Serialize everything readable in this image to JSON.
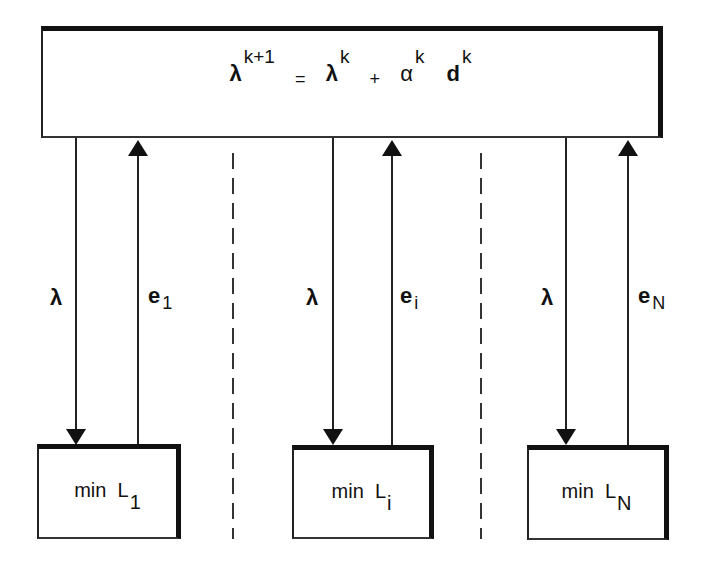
{
  "coordinator": {
    "lhs_symbol": "λ",
    "lhs_superscript": "k+1",
    "equals": "=",
    "term1_symbol": "λ",
    "term1_superscript": "k",
    "plus": "+",
    "term2_symbol": "α",
    "term2_superscript": "k",
    "term3_symbol": "d",
    "term3_superscript": "k"
  },
  "subproblems": [
    {
      "label": "min",
      "symbol": "L",
      "subscript": "1",
      "down_label": "λ",
      "up_label": "e",
      "up_subscript": "1"
    },
    {
      "label": "min",
      "symbol": "L",
      "subscript": "i",
      "down_label": "λ",
      "up_label": "e",
      "up_subscript": "i"
    },
    {
      "label": "min",
      "symbol": "L",
      "subscript": "N",
      "down_label": "λ",
      "up_label": "e",
      "up_subscript": "N"
    }
  ]
}
